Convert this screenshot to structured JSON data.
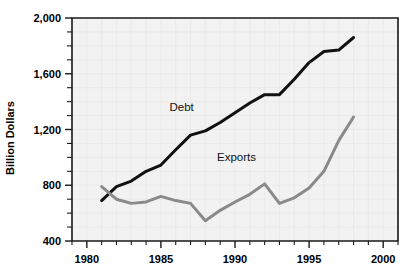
{
  "chart_data": {
    "type": "line",
    "title": "",
    "xlabel": "",
    "ylabel": "Billion Dollars",
    "xlim": [
      1979,
      2001
    ],
    "ylim": [
      400,
      2000
    ],
    "ytick_labels": [
      "400",
      "800",
      "1,200",
      "1,600",
      "2,000"
    ],
    "ytick_values": [
      400,
      800,
      1200,
      1600,
      2000
    ],
    "yminor_step": 100,
    "xtick_labels": [
      "1980",
      "1985",
      "1990",
      "1995",
      "2000"
    ],
    "xtick_values": [
      1980,
      1985,
      1990,
      1995,
      2000
    ],
    "xminor_step": 1,
    "grid": true,
    "legend": "inline-labels",
    "series": [
      {
        "name": "Debt",
        "color": "#111111",
        "stroke_width": 3.0,
        "label_x": 1986.4,
        "label_y": 1330,
        "x": [
          1981,
          1982,
          1983,
          1984,
          1985,
          1986,
          1987,
          1988,
          1989,
          1990,
          1991,
          1992,
          1993,
          1994,
          1995,
          1996,
          1997,
          1998
        ],
        "values": [
          690,
          790,
          830,
          900,
          945,
          1055,
          1160,
          1190,
          1250,
          1320,
          1390,
          1450,
          1450,
          1560,
          1680,
          1760,
          1770,
          1860
        ]
      },
      {
        "name": "Exports",
        "color": "#8a8a8a",
        "stroke_width": 3.0,
        "label_x": 1990.1,
        "label_y": 975,
        "x": [
          1981,
          1982,
          1983,
          1984,
          1985,
          1986,
          1987,
          1988,
          1989,
          1990,
          1991,
          1992,
          1993,
          1994,
          1995,
          1996,
          1997,
          1998
        ],
        "values": [
          790,
          700,
          670,
          680,
          720,
          690,
          670,
          545,
          620,
          680,
          735,
          810,
          670,
          710,
          745,
          780,
          880,
          1010
        ]
      }
    ],
    "series_exports_corrected": {
      "note": "",
      "x": [
        1981,
        1982,
        1983,
        1984,
        1985,
        1986,
        1987,
        1988,
        1989,
        1990,
        1991,
        1992,
        1993,
        1994,
        1995,
        1996,
        1997,
        1998
      ],
      "values": [
        790,
        700,
        670,
        680,
        720,
        690,
        670,
        545,
        620,
        680,
        735,
        810,
        670,
        710,
        780,
        900,
        1120,
        1290
      ]
    }
  },
  "colors": {
    "debt": "#111111",
    "exports": "#8a8a8a",
    "plot_background": "#f2f2f2",
    "axis": "#1a1a1a",
    "page_background": "#ffffff"
  }
}
